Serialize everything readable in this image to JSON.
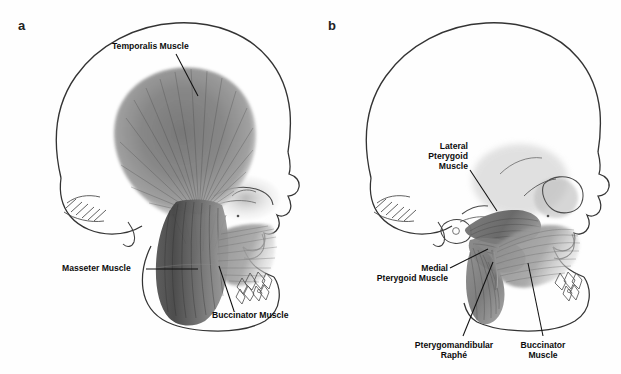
{
  "figure": {
    "background": "#fefefe",
    "ink": "#2b2b2b",
    "muscle_dark": "#4a4a4a",
    "muscle_mid": "#8a8a8a",
    "muscle_light": "#cfcfcf"
  },
  "panels": [
    {
      "letter": "a",
      "letter_pos": {
        "x": 18,
        "y": 19
      },
      "description": "Lateral view of skull showing superficial muscles of mastication",
      "labels": [
        {
          "id": "temporalis-muscle",
          "lines": [
            "Temporalis Muscle"
          ],
          "align": "center",
          "text_pos": {
            "x": 112,
            "y": 41
          },
          "leader": {
            "x1": 176,
            "y1": 54,
            "x2": 198,
            "y2": 96
          }
        },
        {
          "id": "masseter-muscle",
          "lines": [
            "Masseter Muscle"
          ],
          "align": "left",
          "text_pos": {
            "x": 62,
            "y": 263
          },
          "leader": {
            "x1": 146,
            "y1": 269,
            "x2": 198,
            "y2": 269
          }
        },
        {
          "id": "buccinator-muscle",
          "lines": [
            "Buccinator Muscle"
          ],
          "align": "left",
          "text_pos": {
            "x": 212,
            "y": 315
          },
          "leader": {
            "x1": 234,
            "y1": 311,
            "x2": 219,
            "y2": 266
          }
        }
      ]
    },
    {
      "letter": "b",
      "letter_pos": {
        "x": 328,
        "y": 19
      },
      "description": "Lateral view of skull with temporalis and masseter removed showing deep muscles of mastication",
      "labels": [
        {
          "id": "lateral-pterygoid-muscle",
          "lines": [
            "Lateral",
            "Pterygoid",
            "Muscle"
          ],
          "align": "right",
          "text_pos": {
            "x": 468,
            "y": 141
          },
          "leader": {
            "x1": 470,
            "y1": 170,
            "x2": 497,
            "y2": 211
          }
        },
        {
          "id": "medial-pterygoid-muscle",
          "lines": [
            "Medial",
            "Pterygoid Muscle"
          ],
          "align": "right",
          "text_pos": {
            "x": 448,
            "y": 264
          },
          "leader": {
            "x1": 450,
            "y1": 268,
            "x2": 488,
            "y2": 249
          }
        },
        {
          "id": "pterygomandibular-raphe",
          "lines": [
            "Pterygomandibular",
            "Raphé"
          ],
          "align": "center",
          "text_pos": {
            "x": 454,
            "y": 341
          },
          "leader": {
            "x1": 463,
            "y1": 336,
            "x2": 493,
            "y2": 262
          }
        },
        {
          "id": "buccinator-muscle-b",
          "lines": [
            "Buccinator",
            "Muscle"
          ],
          "align": "center",
          "text_pos": {
            "x": 543,
            "y": 341
          },
          "leader": {
            "x1": 543,
            "y1": 336,
            "x2": 528,
            "y2": 263
          }
        }
      ]
    }
  ]
}
